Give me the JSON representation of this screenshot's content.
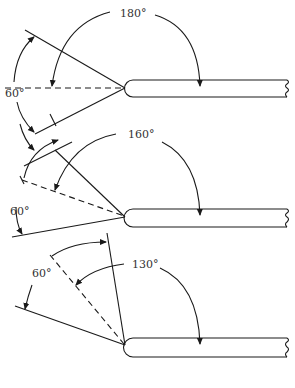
{
  "figure": {
    "panels": [
      {
        "id": "top",
        "rotation_label": "180°",
        "included_angle_label": "60°"
      },
      {
        "id": "middle",
        "rotation_label": "160°",
        "included_angle_label": "60°"
      },
      {
        "id": "bottom",
        "rotation_label": "130°",
        "included_angle_label": "60°"
      }
    ]
  },
  "colors": {
    "line": "#1a1a1a",
    "text": "#333333",
    "background": "#ffffff"
  }
}
